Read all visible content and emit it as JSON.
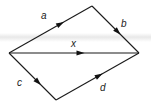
{
  "diagram": {
    "type": "vector-diagram",
    "nodes": [
      {
        "id": "start",
        "role": "left vertex"
      },
      {
        "id": "top",
        "role": "top vertex"
      },
      {
        "id": "end",
        "role": "right vertex"
      },
      {
        "id": "bottom",
        "role": "bottom vertex"
      }
    ],
    "edges": [
      {
        "id": "a",
        "label": "a",
        "from": "start",
        "to": "top",
        "directed": true
      },
      {
        "id": "b",
        "label": "b",
        "from": "top",
        "to": "end",
        "directed": true
      },
      {
        "id": "x",
        "label": "x",
        "from": "start",
        "to": "end",
        "directed": true
      },
      {
        "id": "c",
        "label": "c",
        "from": "start",
        "to": "bottom",
        "directed": true
      },
      {
        "id": "d",
        "label": "d",
        "from": "bottom",
        "to": "end",
        "directed": true
      }
    ],
    "colors": {
      "line": "#1a1a1a",
      "label": "#222222",
      "background": "#ffffff"
    }
  }
}
